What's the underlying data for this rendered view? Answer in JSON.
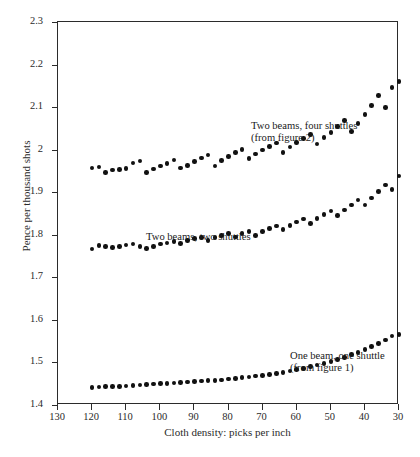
{
  "chart_data": {
    "type": "scatter",
    "title": "",
    "xlabel": "Cloth density: picks per inch",
    "ylabel": "Pence per thousand shots",
    "xlim": [
      130,
      30
    ],
    "ylim": [
      1.4,
      2.3
    ],
    "x_reversed": true,
    "grid": false,
    "legend_position": "in-plot annotations",
    "xticks": [
      130,
      120,
      110,
      100,
      90,
      80,
      70,
      60,
      50,
      40,
      30
    ],
    "yticks": [
      1.4,
      1.5,
      1.6,
      1.7,
      1.8,
      1.9,
      2,
      2.1,
      2.2,
      2.3
    ],
    "x": [
      120,
      118,
      116,
      114,
      112,
      110,
      108,
      106,
      104,
      102,
      100,
      98,
      96,
      94,
      92,
      90,
      88,
      86,
      84,
      82,
      80,
      78,
      76,
      74,
      72,
      70,
      68,
      66,
      64,
      62,
      60,
      58,
      56,
      54,
      52,
      50,
      48,
      46,
      44,
      42,
      40,
      38,
      36,
      34,
      32,
      30
    ],
    "series": [
      {
        "name": "Two beams, four shuttles",
        "note": "(from figure 2)",
        "values": [
          1.957,
          1.959,
          1.947,
          1.952,
          1.954,
          1.956,
          1.969,
          1.973,
          1.946,
          1.955,
          1.962,
          1.968,
          1.976,
          1.957,
          1.963,
          1.972,
          1.98,
          1.987,
          1.962,
          1.974,
          1.984,
          1.993,
          2.0,
          1.979,
          1.99,
          1.999,
          2.008,
          2.016,
          1.994,
          2.006,
          2.017,
          2.026,
          2.036,
          2.013,
          2.028,
          2.041,
          2.054,
          2.068,
          2.042,
          2.062,
          2.083,
          2.104,
          2.127,
          2.099,
          2.146,
          2.16
        ]
      },
      {
        "name": "Two beams, two shuttles",
        "note": "",
        "values": [
          1.767,
          1.775,
          1.772,
          1.77,
          1.773,
          1.776,
          1.778,
          1.773,
          1.768,
          1.773,
          1.778,
          1.781,
          1.784,
          1.779,
          1.786,
          1.791,
          1.794,
          1.786,
          1.793,
          1.798,
          1.803,
          1.795,
          1.803,
          1.808,
          1.799,
          1.808,
          1.815,
          1.821,
          1.812,
          1.822,
          1.83,
          1.837,
          1.827,
          1.838,
          1.847,
          1.856,
          1.845,
          1.858,
          1.87,
          1.882,
          1.87,
          1.886,
          1.901,
          1.917,
          1.906,
          1.938
        ]
      },
      {
        "name": "One beam, one shuttle",
        "note": "(from figure 1)",
        "values": [
          1.441,
          1.442,
          1.443,
          1.443,
          1.444,
          1.445,
          1.446,
          1.447,
          1.448,
          1.449,
          1.45,
          1.451,
          1.452,
          1.453,
          1.454,
          1.455,
          1.456,
          1.457,
          1.458,
          1.459,
          1.461,
          1.462,
          1.464,
          1.466,
          1.468,
          1.47,
          1.472,
          1.474,
          1.477,
          1.48,
          1.483,
          1.486,
          1.49,
          1.494,
          1.498,
          1.502,
          1.507,
          1.512,
          1.518,
          1.524,
          1.53,
          1.537,
          1.545,
          1.553,
          1.562,
          1.566
        ]
      }
    ]
  },
  "annotations": {
    "top": "Two beams, four shuttles\n(from figure 2)",
    "middle": "Two beams, two shuttles",
    "bottom": "One beam, one shuttle\n(from figure 1)"
  },
  "colors": {
    "marker": "#111111",
    "axis": "#2b2b2b",
    "background": "#ffffff",
    "text": "#1a1a1a"
  }
}
